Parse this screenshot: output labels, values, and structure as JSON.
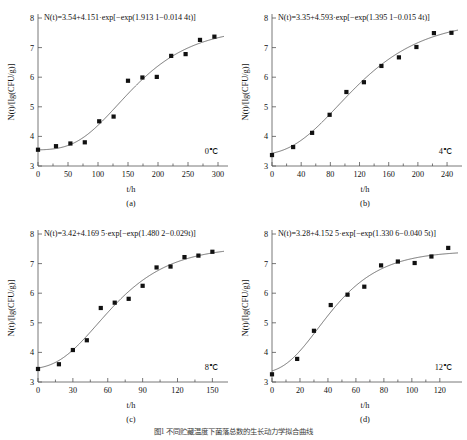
{
  "figure": {
    "caption": "图1  不同贮藏温度下菌落总数的生长动力学拟合曲线",
    "y_axis_label": "N(t)/[lg(CFU/g)]",
    "x_axis_label": "t/h",
    "y_ticks": [
      3,
      4,
      5,
      6,
      7,
      8
    ],
    "ylim": [
      3,
      8
    ]
  },
  "chart_data": [
    {
      "type": "scatter",
      "panel": "a",
      "sub_label": "(a)",
      "title": "",
      "annotation": "N(t)=3.54+4.151·exp[−exp(1.913 1−0.014 4t)]",
      "temperature": "0℃",
      "xlabel": "t/h",
      "ylabel": "N(t)/[lg(CFU/g)]",
      "xlim": [
        0,
        310
      ],
      "ylim": [
        3,
        8
      ],
      "xticks": [
        0,
        50,
        100,
        150,
        200,
        250,
        300
      ],
      "yticks": [
        3,
        4,
        5,
        6,
        7,
        8
      ],
      "grid": false,
      "legend": "none",
      "model": {
        "name": "Gompertz",
        "N0": 3.54,
        "A": 4.151,
        "b": 1.9131,
        "c": 0.0144
      },
      "x": [
        0,
        30,
        54,
        78,
        102,
        126,
        150,
        174,
        198,
        222,
        246,
        270,
        294
      ],
      "y": [
        3.55,
        3.67,
        3.76,
        3.8,
        4.51,
        4.67,
        5.88,
        5.99,
        6.01,
        6.72,
        6.78,
        7.26,
        7.37
      ]
    },
    {
      "type": "scatter",
      "panel": "b",
      "sub_label": "(b)",
      "title": "",
      "annotation": "N(t)=3.35+4.593·exp[−exp(1.395 1−0.015 4t)]",
      "temperature": "4℃",
      "xlabel": "t/h",
      "ylabel": "N(t)/[lg(CFU/g)]",
      "xlim": [
        0,
        255
      ],
      "ylim": [
        3,
        8
      ],
      "xticks": [
        0,
        40,
        80,
        120,
        160,
        200,
        240
      ],
      "yticks": [
        3,
        4,
        5,
        6,
        7,
        8
      ],
      "grid": false,
      "legend": "none",
      "model": {
        "name": "Gompertz",
        "N0": 3.35,
        "A": 4.593,
        "b": 1.3951,
        "c": 0.0154
      },
      "x": [
        0,
        29,
        55,
        79,
        102,
        126,
        150,
        174,
        198,
        222,
        246
      ],
      "y": [
        3.37,
        3.64,
        4.12,
        4.73,
        5.5,
        5.83,
        6.38,
        6.67,
        7.02,
        7.49,
        7.5
      ]
    },
    {
      "type": "scatter",
      "panel": "c",
      "sub_label": "(c)",
      "title": "",
      "annotation": "N(t)=3.42+4.169 5·exp[−exp(1.480 2−0.029t)]",
      "temperature": "8℃",
      "xlabel": "t/h",
      "ylabel": "N(t)/[lg(CFU/g)]",
      "xlim": [
        0,
        160
      ],
      "ylim": [
        3,
        8
      ],
      "xticks": [
        0,
        30,
        60,
        90,
        120,
        150
      ],
      "yticks": [
        3,
        4,
        5,
        6,
        7,
        8
      ],
      "grid": false,
      "legend": "none",
      "model": {
        "name": "Gompertz",
        "N0": 3.42,
        "A": 4.1695,
        "b": 1.4802,
        "c": 0.029
      },
      "x": [
        0,
        18,
        30,
        42,
        54,
        66,
        78,
        90,
        102,
        114,
        126,
        138,
        150
      ],
      "y": [
        3.44,
        3.6,
        4.08,
        4.41,
        5.5,
        5.68,
        5.81,
        6.25,
        6.87,
        6.9,
        7.22,
        7.27,
        7.4
      ]
    },
    {
      "type": "scatter",
      "panel": "d",
      "sub_label": "(d)",
      "title": "",
      "annotation": "N(t)=3.28+4.152 5·exp[−exp(1.330 6−0.040 5t)]",
      "temperature": "12℃",
      "xlabel": "t/h",
      "ylabel": "N(t)/[lg(CFU/g)]",
      "xlim": [
        0,
        133
      ],
      "ylim": [
        3,
        8
      ],
      "xticks": [
        0,
        20,
        40,
        60,
        80,
        100,
        120
      ],
      "yticks": [
        3,
        4,
        5,
        6,
        7,
        8
      ],
      "grid": false,
      "legend": "none",
      "model": {
        "name": "Gompertz",
        "N0": 3.28,
        "A": 4.1525,
        "b": 1.3306,
        "c": 0.0405
      },
      "x": [
        0,
        18,
        30,
        42,
        54,
        66,
        78,
        90,
        102,
        114,
        126
      ],
      "y": [
        3.26,
        3.78,
        4.73,
        5.6,
        5.95,
        6.22,
        6.94,
        7.07,
        7.02,
        7.24,
        7.53
      ]
    }
  ]
}
